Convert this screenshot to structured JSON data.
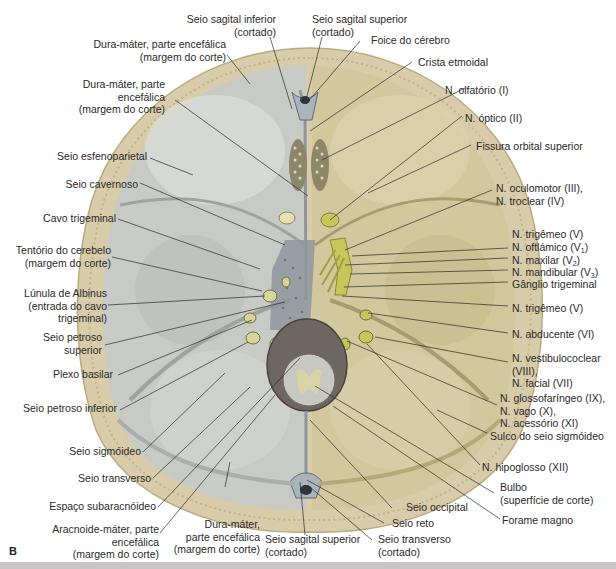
{
  "figure": {
    "panel_letter": "B",
    "colors": {
      "bone": "#d8ccaa",
      "bone_edge": "#b9ab80",
      "dura_grey": "#c8cac6",
      "dura_shadow": "#9ea3a2",
      "fossa_tan": "#d3c79d",
      "nerve_yellow": "#c4c85a",
      "sinus_blue": "#aab4bd",
      "leader_line": "#2a2a2a",
      "bottom_bar": "#c9c5c6"
    }
  },
  "labels_left": [
    {
      "id": "dura-encefalica-1",
      "text": "Dura-máter, parte encefálica\n(margem do corte)"
    },
    {
      "id": "dura-encefalica-2",
      "text": "Dura-máter, parte\nencefálica\n(margem do corte)"
    },
    {
      "id": "seio-esfenoparietal",
      "text": "Seio esfenoparietal"
    },
    {
      "id": "seio-cavernoso",
      "text": "Seio cavernoso"
    },
    {
      "id": "cavo-trigeminal",
      "text": "Cavo trigeminal"
    },
    {
      "id": "tentorio-cerebelo",
      "text": "Tentório do cerebelo\n(margem do corte)"
    },
    {
      "id": "lunula-albinus",
      "text": "Lúnula de Albinus\n(entrada do cavo\ntrigeminal)"
    },
    {
      "id": "seio-petroso-superior",
      "text": "Seio petroso\nsuperior"
    },
    {
      "id": "plexo-basilar",
      "text": "Plexo basilar"
    },
    {
      "id": "seio-petroso-inferior",
      "text": "Seio petroso inferior"
    },
    {
      "id": "seio-sigmoideo",
      "text": "Seio sigmóideo"
    },
    {
      "id": "seio-transverso",
      "text": "Seio transverso"
    },
    {
      "id": "espaco-subaracnoideo",
      "text": "Espaço subaracnóideo"
    },
    {
      "id": "aracnoide-mater",
      "text": "Aracnoide-máter, parte\nencefálica\n(margem do corte)"
    }
  ],
  "labels_top": [
    {
      "id": "seio-sagital-inferior",
      "text": "Seio sagital inferior\n(cortado)"
    },
    {
      "id": "seio-sagital-superior-top",
      "text": "Seio sagital superior\n(cortado)"
    },
    {
      "id": "foice-cerebro",
      "text": "Foice do cérebro"
    },
    {
      "id": "crista-etmoidal",
      "text": "Crista etmoidal"
    }
  ],
  "labels_right": [
    {
      "id": "n-olfatorio",
      "text": "N. olfatório (I)"
    },
    {
      "id": "n-optico",
      "text": "N. óptico (II)"
    },
    {
      "id": "fissura-orbital-superior",
      "text": "Fissura orbital superior"
    },
    {
      "id": "n-oculomotor-troclear",
      "text": "N. oculomotor (III),\nN. troclear (IV)"
    },
    {
      "id": "n-trigemeo-1",
      "text": "N. trigêmeo (V)"
    },
    {
      "id": "n-oftalmico",
      "text": "N. oftlámico (V",
      "sub": "1",
      "tail": ")"
    },
    {
      "id": "n-maxilar",
      "text": "N. maxilar (V",
      "sub": "2",
      "tail": ")"
    },
    {
      "id": "n-mandibular",
      "text": "N. mandibular (V",
      "sub": "3",
      "tail": ")"
    },
    {
      "id": "ganglio-trigeminal",
      "text": "Gânglio trigeminal"
    },
    {
      "id": "n-trigemeo-2",
      "text": "N. trigêmeo (V)"
    },
    {
      "id": "n-abducente",
      "text": "N. abducente (VI)"
    },
    {
      "id": "n-vestibulococlear-facial",
      "text": "N. vestibulococlear\n(VIII),\nN. facial (VII)"
    },
    {
      "id": "n-glosso-vago-acessorio",
      "text": "N. glossofaríngeo (IX),\nN. vago (X),\nN. acessório (XI)"
    },
    {
      "id": "sulco-seio-sigmoideo",
      "text": "Sulco do seio sigmóideo"
    },
    {
      "id": "n-hipoglosso",
      "text": "N. hipoglosso (XII)"
    },
    {
      "id": "bulbo",
      "text": "Bulbo\n(superfície de corte)"
    },
    {
      "id": "forame-magno",
      "text": "Forame magno"
    }
  ],
  "labels_bottom": [
    {
      "id": "dura-encefalica-3",
      "text": "Dura-máter,\nparte encefálica\n(margem do corte)"
    },
    {
      "id": "seio-sagital-superior-bottom",
      "text": "Seio sagital superior\n(cortado)"
    },
    {
      "id": "seio-transverso-cortado",
      "text": "Seio transverso\n(cortado)"
    },
    {
      "id": "seio-reto",
      "text": "Seio reto"
    },
    {
      "id": "seio-occipital",
      "text": "Seio occipital"
    }
  ]
}
